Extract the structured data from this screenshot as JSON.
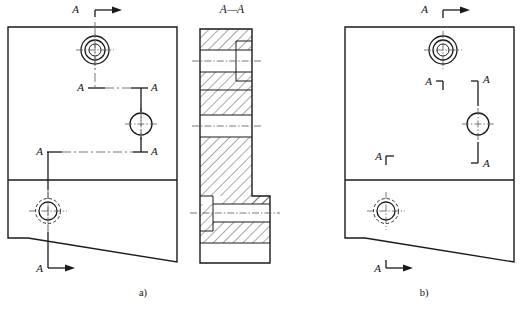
{
  "figure": {
    "type": "engineering-drawing",
    "canvas": {
      "width": 529,
      "height": 309,
      "background": "#ffffff"
    },
    "colors": {
      "line": "#1a1a1a",
      "centerline": "#555555",
      "hidden": "#6a6a6a",
      "background": "#ffffff"
    }
  },
  "panels": [
    {
      "id": "a",
      "caption": "a)",
      "caption_pos": {
        "x": 143,
        "y": 296
      },
      "title_label": "A",
      "convention": "continuous-stepped-cutting-plane-line",
      "body": {
        "left": 8,
        "top": 27,
        "right": 177,
        "divider_y": 180,
        "bottom_left_y": 238,
        "bottom_right_y": 262
      },
      "holes": [
        {
          "name": "counterbored-hole-top",
          "cx": 95,
          "cy": 50,
          "r_outer": 14,
          "r_mid": 10,
          "r_inner": 6
        },
        {
          "name": "plain-hole-middle",
          "cx": 141,
          "cy": 124,
          "r_outer": 11
        },
        {
          "name": "threaded-hole-bottom",
          "cx": 48,
          "cy": 211,
          "r_outer": 12.5,
          "r_inner": 9
        }
      ],
      "cut_labels": [
        {
          "text": "A",
          "x": 79,
          "y": 13,
          "marker": "arrow-right-top"
        },
        {
          "text": "A",
          "x": 78,
          "y": 90,
          "marker": "corner"
        },
        {
          "text": "A",
          "x": 146,
          "y": 90,
          "marker": "corner"
        },
        {
          "text": "A",
          "x": 38,
          "y": 154,
          "marker": "corner"
        },
        {
          "text": "A",
          "x": 146,
          "y": 154,
          "marker": "corner"
        },
        {
          "text": "A",
          "x": 38,
          "y": 272,
          "marker": "arrow-right-bottom"
        }
      ]
    },
    {
      "id": "section",
      "title": "A—A",
      "title_pos": {
        "x": 232,
        "y": 12
      },
      "geometry": {
        "left": 200,
        "right": 252,
        "step_right": 270,
        "top": 29,
        "step_y": 196,
        "bottom": 263
      },
      "features": [
        {
          "name": "counterbore-upper",
          "y_top": 50,
          "y_bottom": 72,
          "bore_x": 236
        },
        {
          "name": "through-bore-lower",
          "y_top": 204,
          "y_bottom": 222,
          "head_x": 213
        }
      ]
    },
    {
      "id": "b",
      "caption": "b)",
      "caption_pos": {
        "x": 424,
        "y": 296
      },
      "title_label": "A",
      "convention": "separate-corner-markers-cutting-plane",
      "body": {
        "left": 345,
        "top": 27,
        "right": 514,
        "divider_y": 180,
        "bottom_left_y": 238,
        "bottom_right_y": 262
      },
      "holes": [
        {
          "name": "counterbored-hole-top",
          "cx": 443,
          "cy": 50,
          "r_outer": 14,
          "r_mid": 10,
          "r_inner": 6
        },
        {
          "name": "plain-hole-middle",
          "cx": 478,
          "cy": 124,
          "r_outer": 11
        },
        {
          "name": "threaded-hole-bottom",
          "cx": 386,
          "cy": 211,
          "r_outer": 12.5,
          "r_inner": 9
        }
      ],
      "cut_labels": [
        {
          "text": "A",
          "x": 428,
          "y": 13,
          "marker": "arrow-right-top"
        },
        {
          "text": "A",
          "x": 428,
          "y": 90,
          "marker": "corner-down-left"
        },
        {
          "text": "A",
          "x": 488,
          "y": 90,
          "marker": "corner-down-right"
        },
        {
          "text": "A",
          "x": 386,
          "y": 154,
          "marker": "corner-up-left"
        },
        {
          "text": "A",
          "x": 488,
          "y": 154,
          "marker": "corner-up-right"
        },
        {
          "text": "A",
          "x": 386,
          "y": 272,
          "marker": "arrow-right-bottom"
        }
      ]
    }
  ],
  "labels": {
    "letter_a": "A",
    "section_title": "A—A",
    "caption_a": "a)",
    "caption_b": "b)"
  }
}
